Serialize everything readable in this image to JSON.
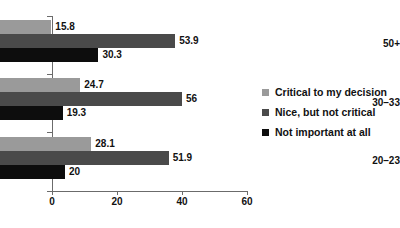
{
  "chart_data": {
    "type": "bar",
    "orientation": "horizontal",
    "title": "",
    "xlabel": "",
    "ylabel": "",
    "xlim": [
      0,
      60
    ],
    "xticks": [
      0,
      20,
      40,
      60
    ],
    "grid": false,
    "legend_position": "right",
    "categories": [
      "50+",
      "30–33",
      "20–23"
    ],
    "series": [
      {
        "name": "Critical to my decision",
        "color": "#9a9a9a",
        "values": [
          15.8,
          24.7,
          28.1
        ],
        "labels": [
          "15.8",
          "24.7",
          "28.1"
        ]
      },
      {
        "name": "Nice, but not critical",
        "color": "#4a4a4a",
        "values": [
          53.9,
          56,
          51.9
        ],
        "labels": [
          "53.9",
          "56",
          "51.9"
        ]
      },
      {
        "name": "Not important at all",
        "color": "#0d0d0d",
        "values": [
          30.3,
          19.3,
          20
        ],
        "labels": [
          "30.3",
          "19.3",
          "20"
        ]
      }
    ]
  },
  "axis": {
    "tick_labels": [
      "0",
      "20",
      "40",
      "60"
    ],
    "line_color": "#6b6b6b"
  },
  "legend": {
    "items": [
      {
        "label": "Critical to my decision",
        "color": "#9a9a9a"
      },
      {
        "label": "Nice, but not critical",
        "color": "#4a4a4a"
      },
      {
        "label": "Not important at all",
        "color": "#0d0d0d"
      }
    ]
  }
}
